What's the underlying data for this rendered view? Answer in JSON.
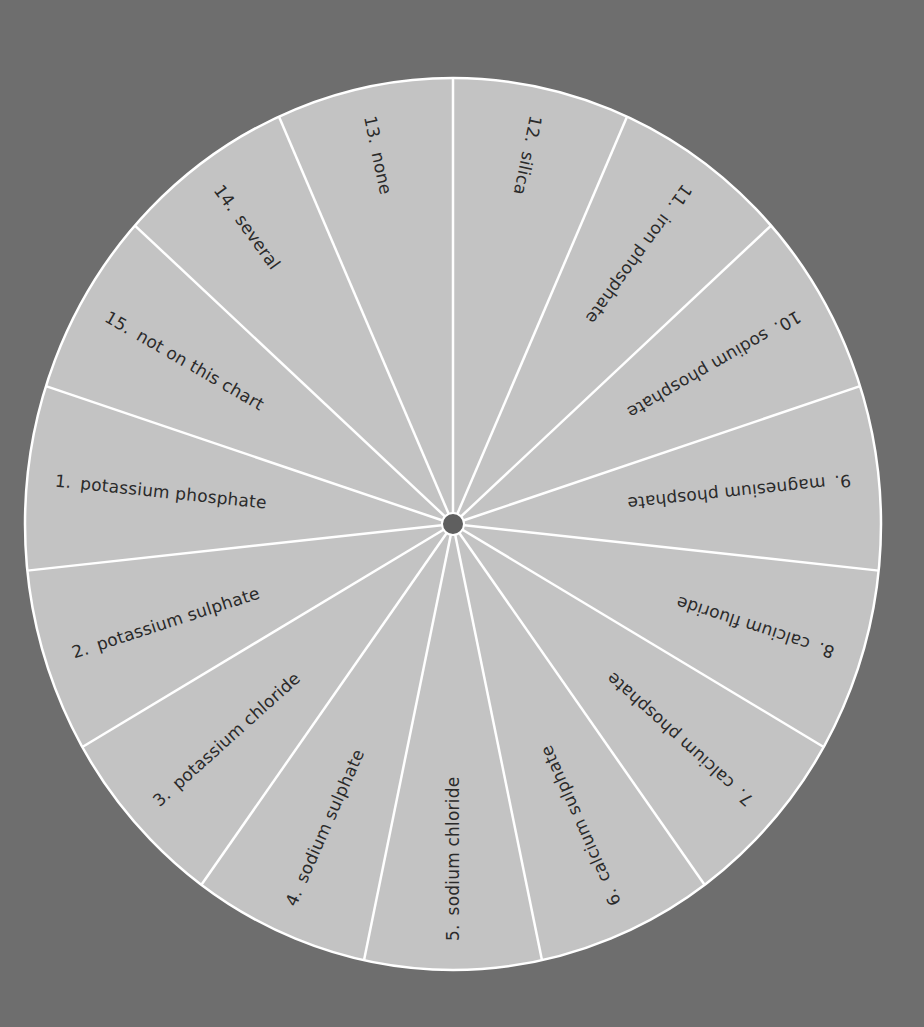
{
  "colors": {
    "background": "#6e6e6e",
    "slice_fill": "#c3c3c3",
    "divider": "#ffffff",
    "hub": "#5f5f5f",
    "text": "#2a2a2a"
  },
  "wheel": {
    "center": [
      453,
      524
    ],
    "radius_x": 428,
    "radius_y": 446,
    "slice_count": 15,
    "slices": [
      {
        "number": "1.",
        "label": "potassium phosphate",
        "mid_angle": 276
      },
      {
        "number": "2.",
        "label": "potassium sulphate",
        "mid_angle": 252
      },
      {
        "number": "3.",
        "label": "potassium chloride",
        "mid_angle": 228
      },
      {
        "number": "4.",
        "label": "sodium sulphate",
        "mid_angle": 204
      },
      {
        "number": "5.",
        "label": "sodium chloride",
        "mid_angle": 180
      },
      {
        "number": "6.",
        "label": "calcium sulphate",
        "mid_angle": 156
      },
      {
        "number": "7.",
        "label": "calcium phosphate",
        "mid_angle": 132
      },
      {
        "number": "8.",
        "label": "calcium fluoride",
        "mid_angle": 108
      },
      {
        "number": "9.",
        "label": "magnesium phosphate",
        "mid_angle": 84
      },
      {
        "number": "10.",
        "label": "sodium phosphate",
        "mid_angle": 60
      },
      {
        "number": "11.",
        "label": "iron phosphate",
        "mid_angle": 36
      },
      {
        "number": "12.",
        "label": "silica",
        "mid_angle": 12
      },
      {
        "number": "13.",
        "label": "none",
        "mid_angle": 348
      },
      {
        "number": "14.",
        "label": "several",
        "mid_angle": 324
      },
      {
        "number": "15.",
        "label": "not on this chart",
        "mid_angle": 300
      }
    ]
  }
}
